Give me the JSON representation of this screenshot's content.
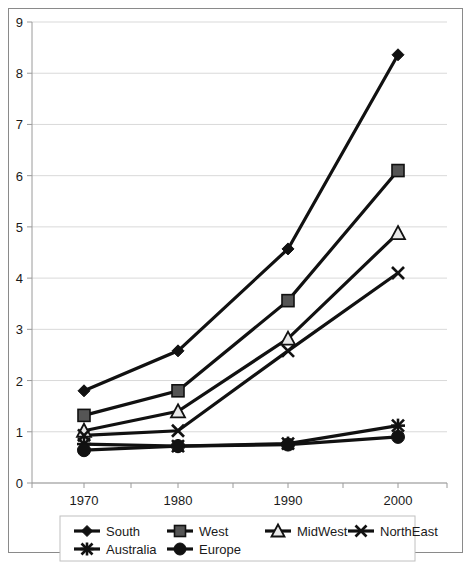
{
  "chart_data": {
    "type": "line",
    "title": "",
    "subtitle": "",
    "xlabel": "",
    "ylabel": "",
    "x": [
      1970,
      1980,
      1990,
      2000
    ],
    "categories": [
      "1970",
      "1980",
      "1990",
      "2000"
    ],
    "xtick_labels": [
      "1970",
      "1980",
      "1990",
      "2000"
    ],
    "ytick_labels": [
      "0",
      "1",
      "2",
      "3",
      "4",
      "5",
      "6",
      "7",
      "8",
      "9"
    ],
    "ylim": [
      0,
      9
    ],
    "ytick_step": 1,
    "grid": "horizontal",
    "legend_position": "bottom",
    "series": [
      {
        "name": "South",
        "marker": "diamond",
        "values": [
          1.8,
          2.58,
          4.57,
          8.36
        ]
      },
      {
        "name": "West",
        "marker": "square",
        "values": [
          1.32,
          1.8,
          3.56,
          6.1
        ]
      },
      {
        "name": "MidWest",
        "marker": "triangle",
        "values": [
          1.02,
          1.4,
          2.82,
          4.88
        ]
      },
      {
        "name": "NorthEast",
        "marker": "cross",
        "values": [
          0.93,
          1.02,
          2.58,
          4.1
        ]
      },
      {
        "name": "Australia",
        "marker": "asterisk",
        "values": [
          0.76,
          0.72,
          0.77,
          1.12
        ]
      },
      {
        "name": "Europe",
        "marker": "circle",
        "values": [
          0.64,
          0.72,
          0.75,
          0.9
        ]
      }
    ]
  },
  "legend": {
    "entries": [
      {
        "label": "South"
      },
      {
        "label": "West"
      },
      {
        "label": "MidWest"
      },
      {
        "label": "NorthEast"
      },
      {
        "label": "Australia"
      },
      {
        "label": "Europe"
      }
    ]
  },
  "colors": {
    "line": "#111111",
    "grid": "#d9d9d9",
    "axis": "#9a9a9a",
    "frame": "#8a8a8a",
    "marker_dark": "#111111",
    "marker_gray": "#555555",
    "marker_light": "#e8e8e8",
    "background": "#ffffff",
    "text": "#1a1a1a"
  }
}
